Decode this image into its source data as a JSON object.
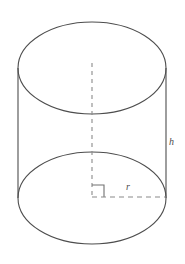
{
  "figure": {
    "name": "cylinder-diagram",
    "background_color": "#ffffff",
    "stroke_color": "#4d4d4d",
    "dash_color": "#808080",
    "canvas": {
      "width": 185,
      "height": 264
    }
  },
  "labels": {
    "height_label": "h",
    "radius_label": "r"
  },
  "geometry": {
    "top_ellipse": {
      "cx": 92,
      "cy": 68,
      "rx": 74,
      "ry": 46
    },
    "bottom_ellipse": {
      "cx": 92,
      "cy": 198,
      "rx": 74,
      "ry": 46
    },
    "left_side": {
      "x": 18,
      "y1": 68,
      "y2": 198
    },
    "right_side": {
      "x": 166,
      "y1": 68,
      "y2": 198
    },
    "axis_dashed": {
      "x": 92,
      "y1": 63,
      "y2": 199
    },
    "radius_dashed": {
      "x1": 92,
      "y": 197,
      "x2": 166
    },
    "right_angle_marker": {
      "x": 92,
      "y": 185,
      "size": 12
    }
  }
}
